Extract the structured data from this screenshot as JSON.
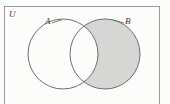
{
  "figure": {
    "type": "venn-diagram",
    "universe_label": "U",
    "set_a_label": "A",
    "set_b_label": "B",
    "shaded_region": "B minus A",
    "colors": {
      "background": "#fdfdfd",
      "rect_stroke": "#9a9a9a",
      "circle_stroke": "#6e6e6e",
      "shade_fill": "#d6d6d4",
      "unshaded_fill": "#ffffff",
      "label_color": "#3a3a3a"
    },
    "geometry": {
      "rect": {
        "x": 4.5,
        "y": 6.5,
        "width": 155,
        "height": 101
      },
      "circle_a": {
        "cx": 63,
        "cy": 54,
        "r": 35
      },
      "circle_b": {
        "cx": 105,
        "cy": 54,
        "r": 35
      },
      "leader_a": {
        "x1": 52,
        "y1": 23,
        "x2": 62,
        "y2": 19.5
      },
      "leader_b": {
        "x1": 124,
        "y1": 23,
        "x2": 113,
        "y2": 20
      }
    }
  }
}
